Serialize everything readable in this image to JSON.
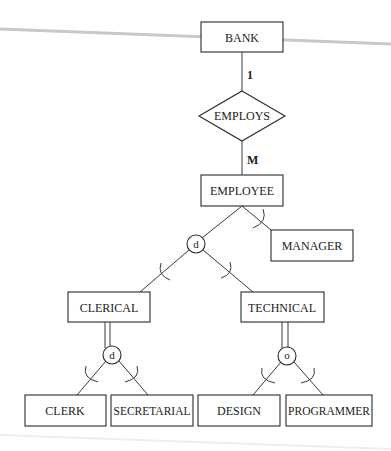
{
  "diagram": {
    "type": "EER diagram",
    "entities": {
      "bank": "BANK",
      "employee": "EMPLOYEE",
      "manager": "MANAGER",
      "clerical": "CLERICAL",
      "technical": "TECHNICAL",
      "clerk": "CLERK",
      "secretarial": "SECRETARIAL",
      "design": "DESIGN",
      "programmer": "PROGRAMMER"
    },
    "relationships": {
      "employs": "EMPLOYS"
    },
    "cardinalities": {
      "bank_side": "1",
      "employee_side": "M"
    },
    "specializations": {
      "employee_disjoint": "d",
      "clerical_disjoint": "d",
      "technical_overlap": "o"
    }
  }
}
